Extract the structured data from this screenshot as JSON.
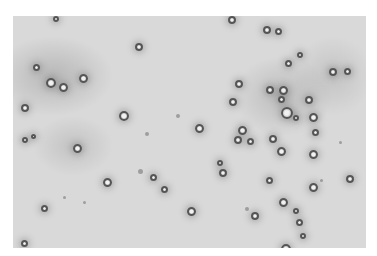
{
  "image": {
    "description": "Grayscale light micrograph showing scattered round particles/cells (dark rings with bright centers) on a light gray background",
    "background_color": "#d9d9d9",
    "particle_ring_color": "#555555",
    "frame_color": "#ffffff"
  }
}
